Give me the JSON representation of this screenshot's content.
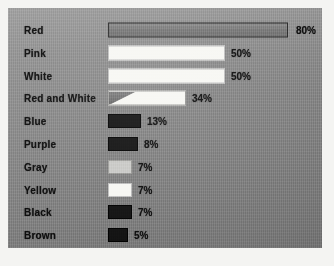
{
  "chart_data": {
    "type": "bar",
    "orientation": "horizontal",
    "title": "",
    "subtitle": "",
    "xlabel": "",
    "ylabel": "",
    "xlim": [
      0,
      100
    ],
    "grid": false,
    "legend": null,
    "units": "percent",
    "categories": [
      "Red",
      "Pink",
      "White",
      "Red and White",
      "Blue",
      "Purple",
      "Gray",
      "Yellow",
      "Black",
      "Brown"
    ],
    "values": [
      80,
      50,
      50,
      34,
      13,
      8,
      7,
      7,
      7,
      5
    ],
    "value_labels": [
      "80%",
      "50%",
      "50%",
      "34%",
      "13%",
      "8%",
      "7%",
      "7%",
      "7%",
      "5%"
    ],
    "bars": [
      {
        "label": "Red",
        "value": 80,
        "value_label": "80%",
        "style": "outline",
        "height": "tall",
        "width_px": 180,
        "value_offset_px": 188
      },
      {
        "label": "Pink",
        "value": 50,
        "value_label": "50%",
        "style": "white",
        "height": "tall",
        "width_px": 117,
        "value_offset_px": 123
      },
      {
        "label": "White",
        "value": 50,
        "value_label": "50%",
        "style": "white",
        "height": "tall",
        "width_px": 117,
        "value_offset_px": 123
      },
      {
        "label": "Red and White",
        "value": 34,
        "value_label": "34%",
        "style": "split",
        "height": "tall",
        "width_px": 78,
        "value_offset_px": 84
      },
      {
        "label": "Blue",
        "value": 13,
        "value_label": "13%",
        "style": "dark",
        "height": "swatch",
        "width_px": 33,
        "value_offset_px": 39
      },
      {
        "label": "Purple",
        "value": 8,
        "value_label": "8%",
        "style": "dark",
        "height": "swatch",
        "width_px": 30,
        "value_offset_px": 36
      },
      {
        "label": "Gray",
        "value": 7,
        "value_label": "7%",
        "style": "lightgray",
        "height": "swatch",
        "width_px": 24,
        "value_offset_px": 30
      },
      {
        "label": "Yellow",
        "value": 7,
        "value_label": "7%",
        "style": "white",
        "height": "swatch",
        "width_px": 24,
        "value_offset_px": 30
      },
      {
        "label": "Black",
        "value": 7,
        "value_label": "7%",
        "style": "dark",
        "height": "swatch",
        "width_px": 24,
        "value_offset_px": 30
      },
      {
        "label": "Brown",
        "value": 5,
        "value_label": "5%",
        "style": "dark",
        "height": "swatch",
        "width_px": 20,
        "value_offset_px": 26
      }
    ]
  },
  "colors": {
    "page_background": "#f4f4f2",
    "panel_background": "#868686",
    "label_text": "#0d0d0d",
    "value_text": "#0b0b0b",
    "bar_white": "#f7f7f3",
    "bar_light_gray": "#c9c9c6",
    "bar_dark": "#121212",
    "bar_outline_fill": "#7c7c7c",
    "bar_outline_stroke": "#2a2a2a"
  }
}
